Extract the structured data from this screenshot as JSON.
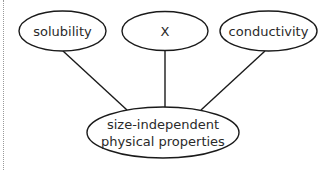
{
  "diagram": {
    "type": "concept-map",
    "colors": {
      "stroke": "#1a1a1a",
      "fill": "#ffffff",
      "text": "#2a2a2a",
      "border": "#9a9a9a"
    },
    "nodes": [
      {
        "id": "solubility",
        "label": "solubility",
        "cx": 62.5,
        "cy": 31,
        "rx": 43.5,
        "ry": 20
      },
      {
        "id": "x",
        "label": "X",
        "cx": 165,
        "cy": 31,
        "rx": 43,
        "ry": 19.5
      },
      {
        "id": "conductivity",
        "label": "conductivity",
        "cx": 268.5,
        "cy": 31,
        "rx": 48.5,
        "ry": 20
      },
      {
        "id": "size-independent",
        "label_line1": "size-independent",
        "label_line2": "physical properties",
        "cx": 163,
        "cy": 132.5,
        "rx": 76,
        "ry": 25.5
      }
    ],
    "edges": [
      {
        "from": "solubility",
        "to": "size-independent"
      },
      {
        "from": "x",
        "to": "size-independent"
      },
      {
        "from": "conductivity",
        "to": "size-independent"
      }
    ]
  }
}
